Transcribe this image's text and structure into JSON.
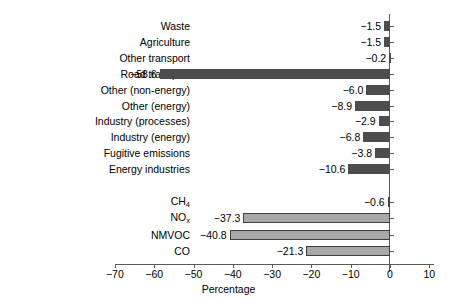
{
  "chart_data": {
    "type": "bar",
    "orientation": "horizontal",
    "title": "",
    "xlabel": "Percentage",
    "ylabel": "",
    "xlim": [
      -70,
      10
    ],
    "xticks": [
      -70,
      -60,
      -50,
      -40,
      -30,
      -20,
      -10,
      0,
      10
    ],
    "xtick_labels": [
      "-70",
      "-60",
      "-50",
      "-40",
      "-30",
      "-20",
      "-10",
      "0",
      "10"
    ],
    "grid": false,
    "legend": null,
    "groups": [
      {
        "name": "sectors",
        "color": "#4d4d4d",
        "categories": [
          "Waste",
          "Agriculture",
          "Other transport",
          "Road transport",
          "Other (non-energy)",
          "Other (energy)",
          "Industry (processes)",
          "Industry (energy)",
          "Fugitive emissions",
          "Energy industries"
        ],
        "values": [
          -1.5,
          -1.5,
          -0.2,
          -58.6,
          -6.0,
          -8.9,
          -2.9,
          -6.8,
          -3.8,
          -10.6
        ],
        "value_labels": [
          "-1.5",
          "-1.5",
          "-0.2",
          "-58.6",
          "-6.0",
          "-8.9",
          "-2.9",
          "-6.8",
          "-3.8",
          "-10.6"
        ]
      },
      {
        "name": "pollutants",
        "color": "#a8a8a8",
        "categories": [
          "CH4",
          "NOx",
          "NMVOC",
          "CO"
        ],
        "category_labels_html": [
          "CH<sub>4</sub>",
          "NO<sub>x</sub>",
          "NMVOC",
          "CO"
        ],
        "values": [
          -0.6,
          -37.3,
          -40.8,
          -21.3
        ],
        "value_labels": [
          "-0.6",
          "-37.3",
          "-40.8",
          "-21.3"
        ]
      }
    ]
  },
  "colors": {
    "bar_dark": "#4d4d4d",
    "bar_light": "#a8a8a8",
    "bar_light_border": "#3f3f3f",
    "axis": "#5a5a5a",
    "text": "#000000",
    "background": "#ffffff"
  },
  "axis": {
    "title": "Percentage"
  }
}
